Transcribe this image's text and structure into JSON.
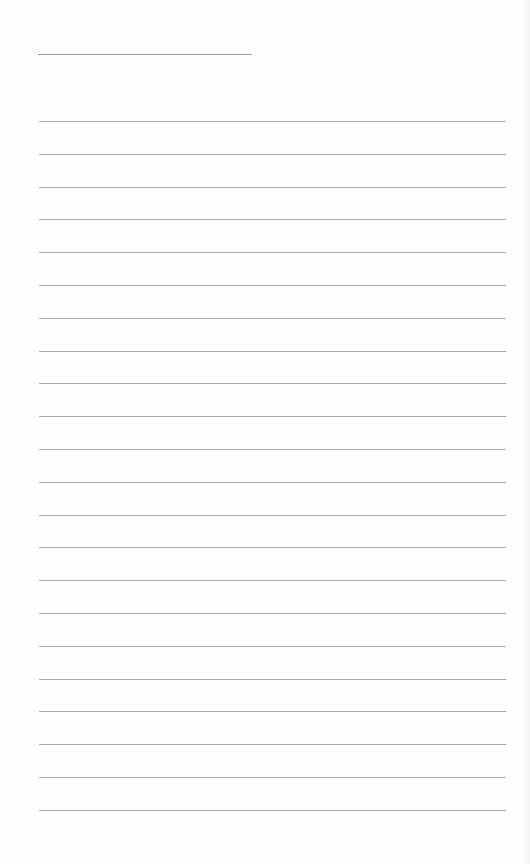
{
  "page": {
    "type": "lined-paper",
    "background": "#fefefe",
    "line_color": "#a8a8a8",
    "title_line": {
      "x": 38,
      "y": 54,
      "width": 214
    },
    "rules": {
      "count": 22,
      "x": 39,
      "width": 467,
      "first_y": 121,
      "spacing": 32.8
    }
  }
}
